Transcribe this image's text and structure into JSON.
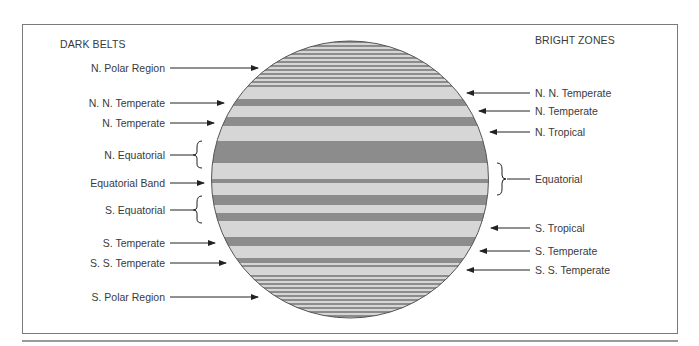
{
  "headings": {
    "left": "DARK BELTS",
    "right": "BRIGHT ZONES"
  },
  "dark_belts": [
    {
      "label": "N. Polar Region",
      "y": 68,
      "pointer": "arrow"
    },
    {
      "label": "N. N. Temperate",
      "y": 103,
      "pointer": "arrow"
    },
    {
      "label": "N. Temperate",
      "y": 123,
      "pointer": "arrow"
    },
    {
      "label": "N. Equatorial",
      "y": 155,
      "pointer": "brace"
    },
    {
      "label": "Equatorial Band",
      "y": 183,
      "pointer": "arrow"
    },
    {
      "label": "S. Equatorial",
      "y": 210,
      "pointer": "brace"
    },
    {
      "label": "S. Temperate",
      "y": 242,
      "pointer": "arrow"
    },
    {
      "label": "S. S. Temperate",
      "y": 263,
      "pointer": "arrow"
    },
    {
      "label": "S. Polar Region",
      "y": 297,
      "pointer": "arrow"
    }
  ],
  "bright_zones": [
    {
      "label": "N. N. Temperate",
      "y": 93,
      "pointer": "arrow"
    },
    {
      "label": "N. Temperate",
      "y": 111,
      "pointer": "arrow"
    },
    {
      "label": "N. Tropical",
      "y": 132,
      "pointer": "arrow"
    },
    {
      "label": "Equatorial",
      "y": 179,
      "pointer": "brace"
    },
    {
      "label": "S. Tropical",
      "y": 228,
      "pointer": "arrow"
    },
    {
      "label": "S. Temperate",
      "y": 251,
      "pointer": "arrow"
    },
    {
      "label": "S. S. Temperate",
      "y": 270,
      "pointer": "arrow"
    }
  ],
  "colors": {
    "dark_belt": "#8c8c8c",
    "bright_zone": "#d6d6d6",
    "outline": "#555555",
    "frame": "#7a7a7a"
  }
}
